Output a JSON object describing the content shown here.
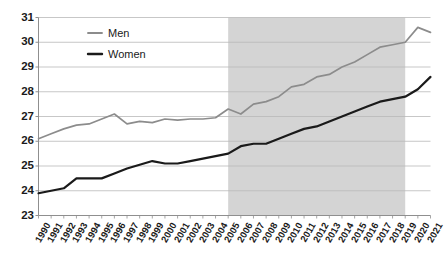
{
  "chart_data": {
    "type": "line",
    "title": "",
    "subtitle": "",
    "xlabel": "",
    "ylabel": "",
    "ylim": [
      23,
      31
    ],
    "ytick_step": 1,
    "yticks": [
      23,
      24,
      25,
      26,
      27,
      28,
      29,
      30,
      31
    ],
    "grid": "horizontal",
    "legend_position": "top-left-inside",
    "x": [
      1990,
      1991,
      1992,
      1993,
      1994,
      1995,
      1996,
      1997,
      1998,
      1999,
      2000,
      2001,
      2002,
      2003,
      2004,
      2005,
      2006,
      2007,
      2008,
      2009,
      2010,
      2011,
      2012,
      2013,
      2014,
      2015,
      2016,
      2017,
      2018,
      2019,
      2020,
      2021
    ],
    "xtick_labels": [
      "1990",
      "1991",
      "1992",
      "1993",
      "1994",
      "1995",
      "1996",
      "1997",
      "1998",
      "1999",
      "2000",
      "2001",
      "2002",
      "2003",
      "2004",
      "2005",
      "2006",
      "2007",
      "2008",
      "2009",
      "2010",
      "2011",
      "2012",
      "2013",
      "2014",
      "2015",
      "2016",
      "2017",
      "2018",
      "2019",
      "2020",
      "2021"
    ],
    "series": [
      {
        "name": "Men",
        "color": "#8c8c8c",
        "values": [
          26.1,
          26.3,
          26.5,
          26.65,
          26.7,
          26.9,
          27.1,
          26.7,
          26.8,
          26.75,
          26.9,
          26.85,
          26.9,
          26.9,
          26.95,
          27.3,
          27.1,
          27.5,
          27.6,
          27.8,
          28.2,
          28.3,
          28.6,
          28.7,
          29.0,
          29.2,
          29.5,
          29.8,
          29.9,
          30.0,
          30.6,
          30.4
        ]
      },
      {
        "name": "Women",
        "color": "#1a1a1a",
        "values": [
          23.9,
          24.0,
          24.1,
          24.5,
          24.5,
          24.5,
          24.7,
          24.9,
          25.05,
          25.2,
          25.1,
          25.1,
          25.2,
          25.3,
          25.4,
          25.5,
          25.8,
          25.9,
          25.9,
          26.1,
          26.3,
          26.5,
          26.6,
          26.8,
          27.0,
          27.2,
          27.4,
          27.6,
          27.7,
          27.8,
          28.1,
          28.6
        ]
      }
    ],
    "shaded_region": {
      "x_start": 2005,
      "x_end": 2019,
      "color": "#d4d4d4"
    },
    "legend": [
      {
        "label": "Men",
        "color": "#8c8c8c"
      },
      {
        "label": "Women",
        "color": "#1a1a1a"
      }
    ]
  }
}
